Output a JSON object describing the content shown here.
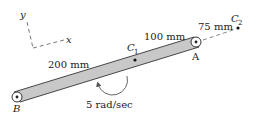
{
  "axes": {
    "y_label": "y",
    "x_label": "x"
  },
  "points": {
    "A": "A",
    "B": "B",
    "C1_main": "C",
    "C1_sub": "1",
    "C2_main": "C",
    "C2_sub": "2"
  },
  "dimensions": {
    "b_to_c1": "200 mm",
    "c1_to_a": "100 mm",
    "a_to_c2": "75 mm"
  },
  "angular_velocity": "5 rad/sec",
  "colors": {
    "bar_fill": "#c8c8c8",
    "stroke": "#333333"
  }
}
